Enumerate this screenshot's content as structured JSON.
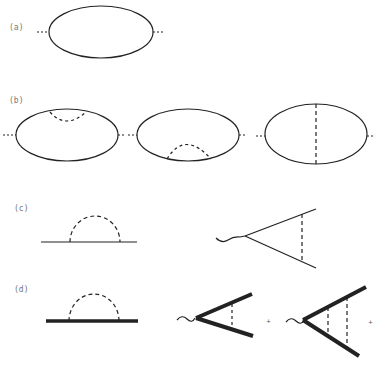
{
  "figure": {
    "panels": [
      {
        "label": "(a)",
        "description": "one-loop bubble: solid ellipse with dashed external legs"
      },
      {
        "label": "(b)",
        "description": "three two-loop bubbles: upper self-energy, lower self-energy, vertical exchange"
      },
      {
        "label": "(c)",
        "description": "self-energy with dashed arc; vertex with wavy external line and dashed rung"
      },
      {
        "label": "(d)",
        "description": "dressed (thick) propagator self-energy; ladder vertices with one and two rungs"
      }
    ],
    "connectors": [
      "+",
      "+"
    ]
  }
}
